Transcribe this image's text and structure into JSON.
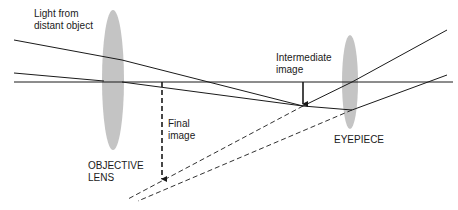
{
  "labels": {
    "light": "Light from\ndistant object",
    "intermediate": "Intermediate\nimage",
    "final": "Final\nimage",
    "objective": "OBJECTIVE\nLENS",
    "eyepiece": "EYEPIECE"
  },
  "colors": {
    "lens_fill": "#c4c4c4",
    "ray": "#1a1a1a",
    "background": "#ffffff"
  }
}
